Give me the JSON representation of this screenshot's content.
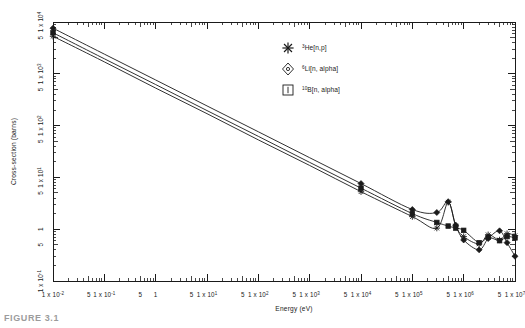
{
  "figure": {
    "caption": "FIGURE 3.1"
  },
  "chart_data": {
    "type": "line",
    "title": "",
    "xlabel": "Energy (eV)",
    "ylabel": "Cross-section (barns)",
    "xscale": "log",
    "yscale": "log",
    "xlim": [
      0.01,
      10000000
    ],
    "ylim": [
      0.1,
      10000
    ],
    "grid": false,
    "legend_position": "top-center",
    "xticks": [
      {
        "value": 0.01,
        "label": "1 x 10",
        "exponent": "-2"
      },
      {
        "value": 0.05,
        "label": "5",
        "exponent": ""
      },
      {
        "value": 0.1,
        "label": "1 x 10",
        "exponent": "-1"
      },
      {
        "value": 0.5,
        "label": "5",
        "exponent": ""
      },
      {
        "value": 1,
        "label": "1",
        "exponent": ""
      },
      {
        "value": 5,
        "label": "5",
        "exponent": ""
      },
      {
        "value": 10,
        "label": "1 x 10",
        "exponent": "1"
      },
      {
        "value": 50,
        "label": "5",
        "exponent": ""
      },
      {
        "value": 100,
        "label": "1 x 10",
        "exponent": "2"
      },
      {
        "value": 500,
        "label": "5",
        "exponent": ""
      },
      {
        "value": 1000,
        "label": "1 x 10",
        "exponent": "3"
      },
      {
        "value": 5000,
        "label": "5",
        "exponent": ""
      },
      {
        "value": 10000,
        "label": "1 x 10",
        "exponent": "4"
      },
      {
        "value": 50000,
        "label": "5",
        "exponent": ""
      },
      {
        "value": 100000,
        "label": "1 x 10",
        "exponent": "5"
      },
      {
        "value": 500000,
        "label": "5",
        "exponent": ""
      },
      {
        "value": 1000000,
        "label": "1 x 10",
        "exponent": "6"
      },
      {
        "value": 5000000,
        "label": "5",
        "exponent": ""
      },
      {
        "value": 10000000,
        "label": "1 x 10",
        "exponent": "7"
      }
    ],
    "yticks": [
      {
        "value": 0.1,
        "label": "1 x 10",
        "exponent": "-1"
      },
      {
        "value": 0.5,
        "label": "5",
        "exponent": ""
      },
      {
        "value": 1,
        "label": "1",
        "exponent": ""
      },
      {
        "value": 5,
        "label": "5",
        "exponent": ""
      },
      {
        "value": 10,
        "label": "1 x 10",
        "exponent": "1"
      },
      {
        "value": 50,
        "label": "5",
        "exponent": ""
      },
      {
        "value": 100,
        "label": "1 x 10",
        "exponent": "2"
      },
      {
        "value": 500,
        "label": "5",
        "exponent": ""
      },
      {
        "value": 1000,
        "label": "1 x 10",
        "exponent": "3"
      },
      {
        "value": 5000,
        "label": "5",
        "exponent": ""
      },
      {
        "value": 10000,
        "label": "1 x 10",
        "exponent": "4"
      }
    ],
    "series": [
      {
        "name": "3He[n,p]",
        "label_prefix": "3",
        "label_main": "He[n,p]",
        "marker": "asterisk",
        "points": [
          [
            0.01,
            5300
          ],
          [
            0.1,
            1700
          ],
          [
            1,
            530
          ],
          [
            10,
            170
          ],
          [
            100,
            53
          ],
          [
            1000,
            17
          ],
          [
            10000,
            5.3
          ],
          [
            100000,
            1.75
          ],
          [
            300000,
            1.05
          ],
          [
            500000,
            3.3
          ],
          [
            700000,
            1.15
          ],
          [
            1000000,
            0.72
          ],
          [
            2000000,
            0.52
          ],
          [
            3000000,
            0.78
          ],
          [
            5000000,
            0.62
          ],
          [
            7000000,
            0.82
          ],
          [
            10000000,
            0.75
          ]
        ]
      },
      {
        "name": "6Li[n, alpha]",
        "label_prefix": "6",
        "label_main": "Li[n, alpha]",
        "marker": "diamond",
        "points": [
          [
            0.01,
            7600
          ],
          [
            0.1,
            2400
          ],
          [
            1,
            760
          ],
          [
            10,
            240
          ],
          [
            100,
            76
          ],
          [
            1000,
            24
          ],
          [
            10000,
            7.6
          ],
          [
            100000,
            2.4
          ],
          [
            300000,
            2.1
          ],
          [
            500000,
            3.4
          ],
          [
            700000,
            1.2
          ],
          [
            1000000,
            0.62
          ],
          [
            2000000,
            0.4
          ],
          [
            3000000,
            0.66
          ],
          [
            5000000,
            0.93
          ],
          [
            7000000,
            0.55
          ],
          [
            10000000,
            0.3
          ]
        ]
      },
      {
        "name": "10B[n, alpha]",
        "label_prefix": "10",
        "label_main": "B[n, alpha]",
        "marker": "square",
        "points": [
          [
            0.01,
            6200
          ],
          [
            0.1,
            1950
          ],
          [
            1,
            620
          ],
          [
            10,
            195
          ],
          [
            100,
            62
          ],
          [
            1000,
            19.5
          ],
          [
            10000,
            6.2
          ],
          [
            100000,
            2.0
          ],
          [
            300000,
            1.35
          ],
          [
            500000,
            1.15
          ],
          [
            700000,
            1.05
          ],
          [
            1000000,
            0.95
          ],
          [
            2000000,
            0.55
          ],
          [
            3000000,
            0.7
          ],
          [
            5000000,
            0.6
          ],
          [
            7000000,
            0.72
          ],
          [
            10000000,
            0.68
          ]
        ]
      }
    ],
    "annotations": []
  }
}
